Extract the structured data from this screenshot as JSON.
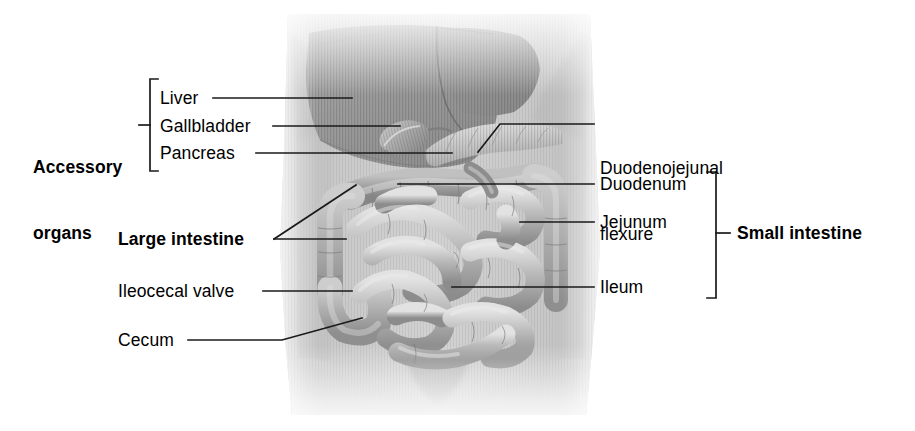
{
  "figure": {
    "background_color": "#ffffff",
    "line_color": "#1a1a1a",
    "text_color": "#000000"
  },
  "group_labels": {
    "accessory": {
      "line1": "Accessory",
      "line2": "organs"
    },
    "small_intestine": "Small intestine",
    "large_intestine": "Large intestine"
  },
  "left_labels": [
    {
      "id": "liver",
      "text": "Liver"
    },
    {
      "id": "gallbladder",
      "text": "Gallbladder"
    },
    {
      "id": "pancreas",
      "text": "Pancreas"
    },
    {
      "id": "ileocecal-valve",
      "text": "Ileocecal valve"
    },
    {
      "id": "cecum",
      "text": "Cecum"
    }
  ],
  "right_labels": [
    {
      "id": "duodenojejunal-flexure",
      "line1": "Duodenojejunal",
      "line2": "flexure"
    },
    {
      "id": "duodenum",
      "text": "Duodenum"
    },
    {
      "id": "jejunum",
      "text": "Jejunum"
    },
    {
      "id": "ileum",
      "text": "Ileum"
    }
  ],
  "anatomy_structures": [
    {
      "id": "liver",
      "label": "Liver",
      "group": "Accessory organs"
    },
    {
      "id": "gallbladder",
      "label": "Gallbladder",
      "group": "Accessory organs"
    },
    {
      "id": "pancreas",
      "label": "Pancreas",
      "group": "Accessory organs"
    },
    {
      "id": "large-intestine",
      "label": "Large intestine",
      "group": "Large intestine"
    },
    {
      "id": "ileocecal-valve",
      "label": "Ileocecal valve",
      "group": "Large intestine"
    },
    {
      "id": "cecum",
      "label": "Cecum",
      "group": "Large intestine"
    },
    {
      "id": "duodenojejunal-flexure",
      "label": "Duodenojejunal flexure",
      "group": "Small intestine"
    },
    {
      "id": "duodenum",
      "label": "Duodenum",
      "group": "Small intestine"
    },
    {
      "id": "jejunum",
      "label": "Jejunum",
      "group": "Small intestine"
    },
    {
      "id": "ileum",
      "label": "Ileum",
      "group": "Small intestine"
    }
  ]
}
